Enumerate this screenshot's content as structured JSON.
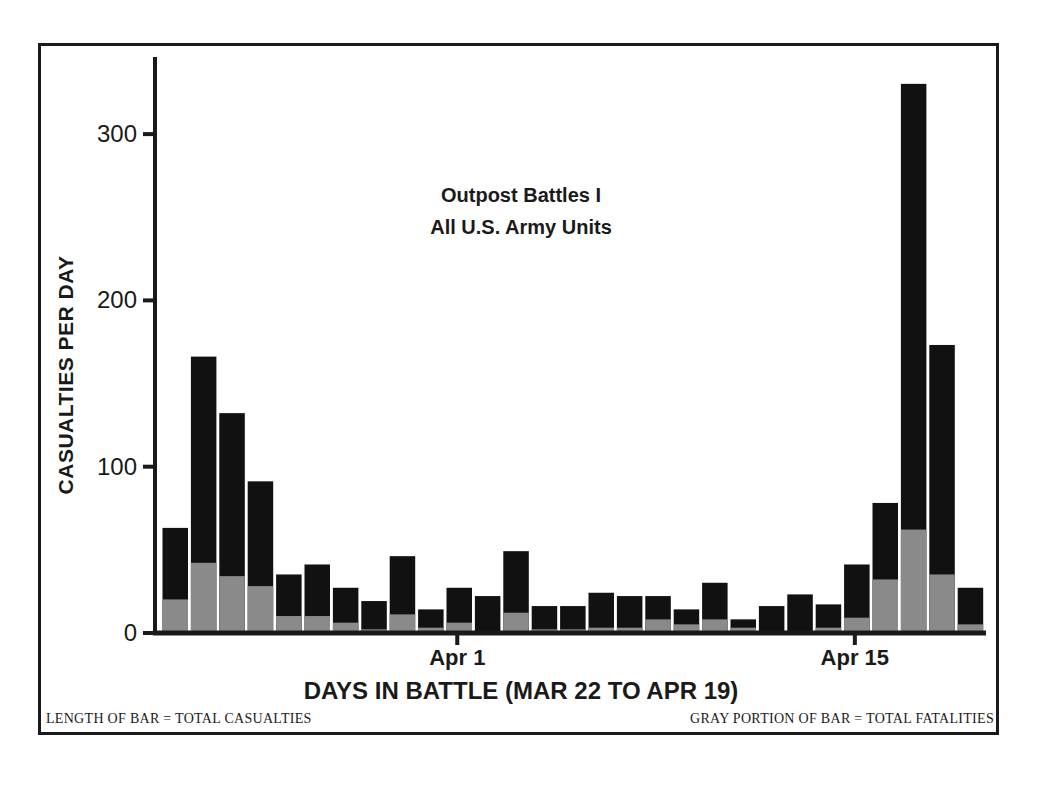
{
  "chart_data": {
    "type": "bar",
    "stacked": true,
    "title": "Outpost Battles I",
    "subtitle": "All U.S. Army Units",
    "xlabel": "DAYS IN BATTLE (MAR 22 TO APR 19)",
    "ylabel": "CASUALTIES PER DAY",
    "ylim": [
      0,
      345
    ],
    "yticks": [
      0,
      100,
      200,
      300
    ],
    "xtick_labels": [
      {
        "label": "Apr 1",
        "index": 10
      },
      {
        "label": "Apr 15",
        "index": 24
      }
    ],
    "categories": [
      "Mar 22",
      "Mar 23",
      "Mar 24",
      "Mar 25",
      "Mar 26",
      "Mar 27",
      "Mar 28",
      "Mar 29",
      "Mar 30",
      "Mar 31",
      "Apr 1",
      "Apr 2",
      "Apr 3",
      "Apr 4",
      "Apr 5",
      "Apr 6",
      "Apr 7",
      "Apr 8",
      "Apr 9",
      "Apr 10",
      "Apr 11",
      "Apr 12",
      "Apr 13",
      "Apr 14",
      "Apr 15",
      "Apr 16",
      "Apr 17",
      "Apr 18",
      "Apr 19"
    ],
    "series": [
      {
        "name": "Total Casualties",
        "color": "#111111",
        "values": [
          62,
          165,
          131,
          90,
          34,
          40,
          26,
          18,
          45,
          13,
          26,
          21,
          48,
          15,
          15,
          23,
          21,
          21,
          13,
          29,
          7,
          15,
          22,
          16,
          40,
          77,
          329,
          172,
          26
        ]
      },
      {
        "name": "Total Fatalities",
        "color": "#8a8a8a",
        "values": [
          19,
          41,
          33,
          27,
          9,
          9,
          5,
          1,
          10,
          2,
          5,
          0,
          11,
          1,
          1,
          2,
          2,
          7,
          4,
          7,
          2,
          0,
          0,
          2,
          8,
          31,
          61,
          34,
          4
        ]
      }
    ],
    "legend_notes": {
      "left": "LENGTH OF BAR = TOTAL CASUALTIES",
      "right": "GRAY PORTION OF BAR = TOTAL FATALITIES"
    },
    "grid": false
  }
}
